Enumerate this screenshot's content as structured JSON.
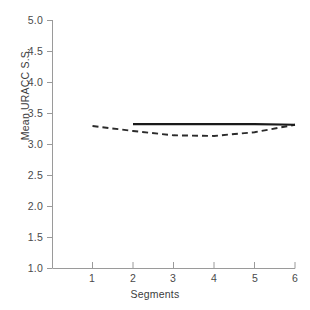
{
  "chart_data": {
    "type": "line",
    "title": "",
    "xlabel": "Segments",
    "ylabel": "Mean URACC S.S.",
    "x": [
      1,
      2,
      3,
      4,
      5,
      6
    ],
    "xlim": [
      0.55,
      6.0
    ],
    "ylim": [
      1.0,
      5.0
    ],
    "xticks": [
      1,
      2,
      3,
      4,
      5,
      6
    ],
    "xtick_labels": [
      "1",
      "2",
      "3",
      "4",
      "5",
      "6"
    ],
    "yticks": [
      1.0,
      1.5,
      2.0,
      2.5,
      3.0,
      3.5,
      4.0,
      4.5,
      5.0
    ],
    "ytick_labels": [
      "1.0",
      "1.5",
      "2.0",
      "2.5",
      "3.0",
      "3.5",
      "4.0",
      "4.5",
      "5.0"
    ],
    "grid": false,
    "legend": "none",
    "series": [
      {
        "name": "solid-series",
        "style": "solid",
        "color": "#1a1a1a",
        "x": [
          2,
          3,
          4,
          5,
          6
        ],
        "values": [
          3.32,
          3.32,
          3.32,
          3.32,
          3.31
        ]
      },
      {
        "name": "dashed-series",
        "style": "dashed",
        "color": "#2b2b2b",
        "x": [
          1,
          2,
          3,
          4,
          5,
          6
        ],
        "values": [
          3.29,
          3.21,
          3.14,
          3.13,
          3.19,
          3.31
        ]
      }
    ]
  },
  "axes": {
    "spine_color": "#9a9a9a",
    "tick_color": "#9a9a9a",
    "background": "#ffffff"
  }
}
